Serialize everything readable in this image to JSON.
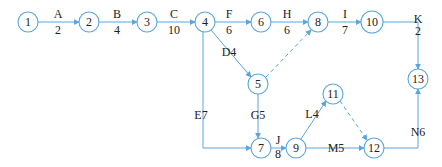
{
  "diagram": {
    "type": "activity-on-arrow network",
    "colors": {
      "line": "#5aa6dc",
      "text": "#222222",
      "node_fill": "#ffffff"
    },
    "nodes": [
      {
        "id": "1",
        "x": 28,
        "y": 22
      },
      {
        "id": "2",
        "x": 89,
        "y": 22
      },
      {
        "id": "3",
        "x": 147,
        "y": 22
      },
      {
        "id": "4",
        "x": 205,
        "y": 22
      },
      {
        "id": "6",
        "x": 261,
        "y": 22
      },
      {
        "id": "8",
        "x": 318,
        "y": 22
      },
      {
        "id": "10",
        "x": 372,
        "y": 22
      },
      {
        "id": "5",
        "x": 258,
        "y": 84
      },
      {
        "id": "13",
        "x": 418,
        "y": 79
      },
      {
        "id": "11",
        "x": 333,
        "y": 94
      },
      {
        "id": "7",
        "x": 261,
        "y": 148
      },
      {
        "id": "9",
        "x": 296,
        "y": 148
      },
      {
        "id": "12",
        "x": 374,
        "y": 148
      }
    ],
    "activities": [
      {
        "from": "1",
        "to": "2",
        "name": "A",
        "duration": "2"
      },
      {
        "from": "2",
        "to": "3",
        "name": "B",
        "duration": "4"
      },
      {
        "from": "3",
        "to": "4",
        "name": "C",
        "duration": "10"
      },
      {
        "from": "4",
        "to": "6",
        "name": "F",
        "duration": "6"
      },
      {
        "from": "6",
        "to": "8",
        "name": "H",
        "duration": "6"
      },
      {
        "from": "8",
        "to": "10",
        "name": "I",
        "duration": "7"
      },
      {
        "from": "10",
        "to": "13",
        "name": "K",
        "duration": "2"
      },
      {
        "from": "4",
        "to": "5",
        "name": "D",
        "duration": "4",
        "label": "D4"
      },
      {
        "from": "4",
        "to": "7",
        "name": "E",
        "duration": "7",
        "label": "E7"
      },
      {
        "from": "5",
        "to": "7",
        "name": "G",
        "duration": "5",
        "label": "G5"
      },
      {
        "from": "7",
        "to": "9",
        "name": "J",
        "duration": "8"
      },
      {
        "from": "9",
        "to": "11",
        "name": "L",
        "duration": "4",
        "label": "L4"
      },
      {
        "from": "9",
        "to": "12",
        "name": "M",
        "duration": "5",
        "label": "M5"
      },
      {
        "from": "12",
        "to": "13",
        "name": "N",
        "duration": "6",
        "label": "N6"
      },
      {
        "from": "5",
        "to": "8",
        "name": "dummy",
        "dashed": true
      },
      {
        "from": "11",
        "to": "12",
        "name": "dummy",
        "dashed": true
      }
    ]
  },
  "labels": {
    "A": "A",
    "A_d": "2",
    "B": "B",
    "B_d": "4",
    "C": "C",
    "C_d": "10",
    "F": "F",
    "F_d": "6",
    "H": "H",
    "H_d": "6",
    "I": "I",
    "I_d": "7",
    "K": "K",
    "K_d": "2",
    "J": "J",
    "J_d": "8",
    "D4": "D4",
    "E7": "E7",
    "G5": "G5",
    "L4": "L4",
    "M5": "M5",
    "N6": "N6"
  },
  "node_labels": {
    "n1": "1",
    "n2": "2",
    "n3": "3",
    "n4": "4",
    "n5": "5",
    "n6": "6",
    "n7": "7",
    "n8": "8",
    "n9": "9",
    "n10": "10",
    "n11": "11",
    "n12": "12",
    "n13": "13"
  }
}
